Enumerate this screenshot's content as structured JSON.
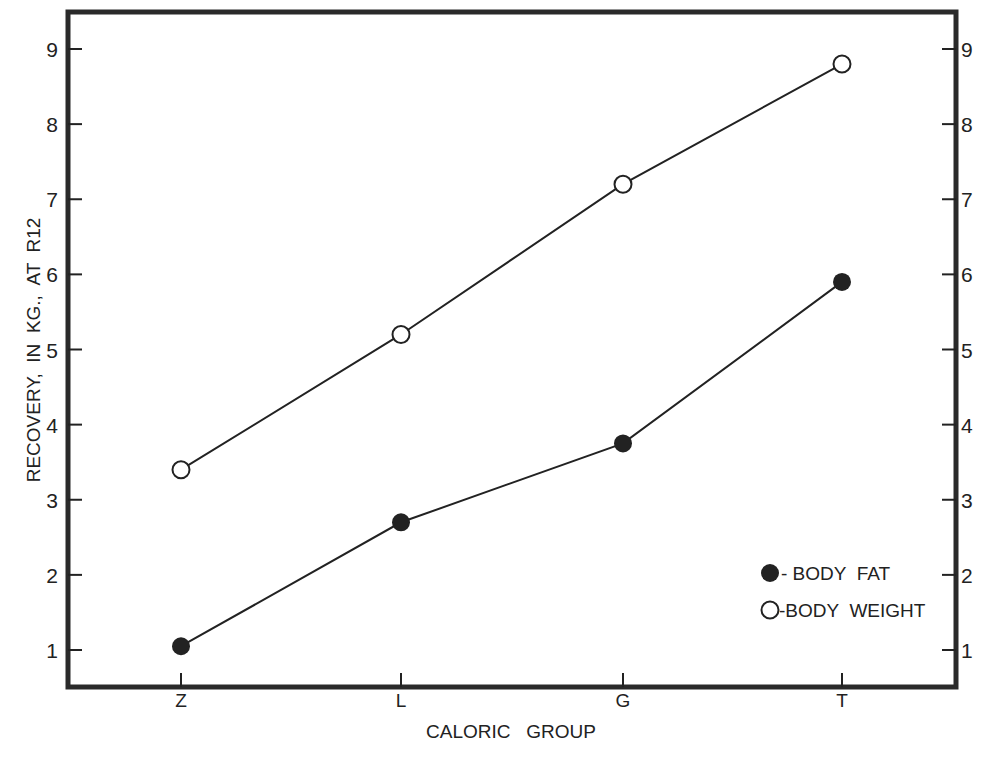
{
  "chart_data": {
    "type": "line",
    "title": "",
    "xlabel": "CALORIC GROUP",
    "ylabel": "RECOVERY, IN KG., AT R12",
    "categories": [
      "Z",
      "L",
      "G",
      "T"
    ],
    "series": [
      {
        "name": "BODY FAT",
        "marker": "filled-circle",
        "values": [
          1.05,
          2.7,
          3.75,
          5.9
        ]
      },
      {
        "name": "BODY WEIGHT",
        "marker": "open-circle",
        "values": [
          3.4,
          5.2,
          7.2,
          8.8
        ]
      }
    ],
    "ylim": [
      0.5,
      9.5
    ],
    "yticks": [
      1,
      2,
      3,
      4,
      5,
      6,
      7,
      8,
      9
    ],
    "right_axis_ticks": [
      1,
      2,
      3,
      4,
      5,
      6,
      7,
      8,
      9
    ],
    "grid": false,
    "legend_position": "lower right, inside plot"
  },
  "legend": {
    "fat_label": "- BODY  FAT",
    "weight_label": "-BODY  WEIGHT"
  },
  "axes": {
    "xlabel": "CALORIC   GROUP",
    "ylabel": "RECOVERY,  IN  KG.,  AT  R12"
  }
}
